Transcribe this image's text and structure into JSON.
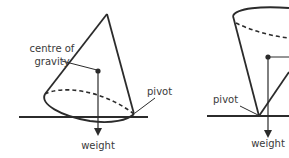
{
  "diagram": {
    "left_figure": {
      "labels": {
        "cog_line1": "centre of",
        "cog_line2": "gravity",
        "pivot": "pivot",
        "weight": "weight"
      }
    },
    "right_figure": {
      "labels": {
        "pivot": "pivot",
        "weight": "weight"
      }
    },
    "colors": {
      "stroke": "#2b2b2b",
      "text": "#3a3a3a",
      "background": "#ffffff"
    }
  }
}
